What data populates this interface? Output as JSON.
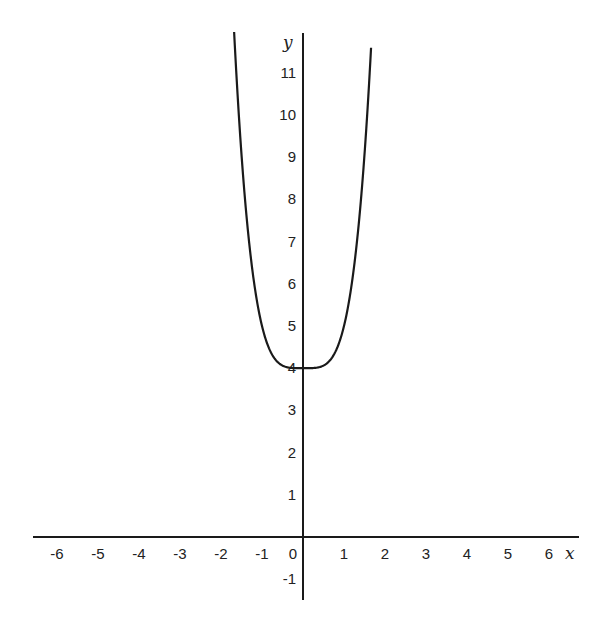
{
  "chart_data": {
    "type": "line",
    "title": "",
    "xlabel": "x",
    "ylabel": "y",
    "function": "y = x^4 + 4",
    "xlim": [
      -6.6,
      6.6
    ],
    "ylim": [
      -1.6,
      12.0
    ],
    "x_ticks": [
      -6,
      -5,
      -4,
      -3,
      -2,
      -1,
      0,
      1,
      2,
      3,
      4,
      5,
      6
    ],
    "y_ticks": [
      -1,
      1,
      2,
      3,
      4,
      5,
      6,
      7,
      8,
      9,
      10,
      11
    ],
    "grid": false,
    "legend": "none",
    "series": [
      {
        "name": "curve",
        "x_range": [
          -1.68,
          1.66
        ],
        "points": [
          [
            -1.68,
            11.97
          ],
          [
            -1.6,
            10.55
          ],
          [
            -1.5,
            9.06
          ],
          [
            -1.4,
            7.84
          ],
          [
            -1.3,
            6.86
          ],
          [
            -1.2,
            6.07
          ],
          [
            -1.1,
            5.46
          ],
          [
            -1.0,
            5.0
          ],
          [
            -0.8,
            4.41
          ],
          [
            -0.6,
            4.13
          ],
          [
            -0.4,
            4.03
          ],
          [
            -0.2,
            4.0
          ],
          [
            0,
            4.0
          ],
          [
            0.2,
            4.0
          ],
          [
            0.4,
            4.03
          ],
          [
            0.6,
            4.13
          ],
          [
            0.8,
            4.41
          ],
          [
            1.0,
            5.0
          ],
          [
            1.1,
            5.46
          ],
          [
            1.2,
            6.07
          ],
          [
            1.3,
            6.86
          ],
          [
            1.4,
            7.84
          ],
          [
            1.5,
            9.06
          ],
          [
            1.6,
            10.55
          ],
          [
            1.66,
            11.59
          ]
        ],
        "color": "#1a1a1a"
      }
    ]
  }
}
